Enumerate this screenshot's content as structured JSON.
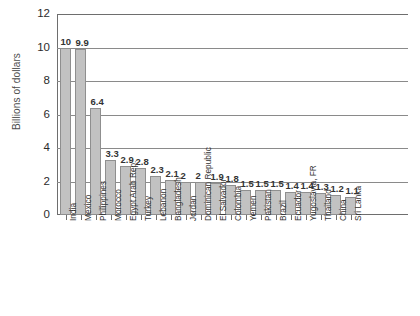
{
  "chart_data": {
    "type": "bar",
    "title": "",
    "xlabel": "",
    "ylabel": "Billions of dollars",
    "ylim": [
      0,
      12
    ],
    "yticks": [
      0,
      2,
      4,
      6,
      8,
      10,
      12
    ],
    "ytick_labels": [
      "0",
      "2",
      "4",
      "6",
      "8",
      "10",
      "12"
    ],
    "grid": true,
    "grid_axis": "y",
    "legend": false,
    "bar_color": "#c2c2c2",
    "bar_edge_color": "#8f8f8f",
    "axis_color": "#6e6e6e",
    "value_label_color": "#333333",
    "background": "#ffffff",
    "categories": [
      "India",
      "Mexico",
      "Philippines",
      "Morocco",
      "Egypt Arab Rep.",
      "Turkey",
      "Lebanon",
      "Bangladesh",
      "Jordan",
      "Dominican Republic",
      "El Salvador",
      "Colombia",
      "Yemen",
      "Pakistan",
      "Brazil",
      "Ecuador",
      "Yugoslavia, FR",
      "Thailand",
      "China",
      "Sri Lanka"
    ],
    "values": [
      10,
      9.9,
      6.4,
      3.3,
      2.9,
      2.8,
      2.3,
      2.1,
      2,
      2,
      1.9,
      1.8,
      1.5,
      1.5,
      1.5,
      1.4,
      1.4,
      1.3,
      1.2,
      1.1
    ],
    "value_labels": [
      "10",
      "9.9",
      "6.4",
      "3.3",
      "2.9",
      "2.8",
      "2.3",
      "2.1",
      "2",
      "2",
      "1.9",
      "1.8",
      "1.5",
      "1.5",
      "1.5",
      "1.4",
      "1.4",
      "1.3",
      "1.2",
      "1.1"
    ]
  }
}
